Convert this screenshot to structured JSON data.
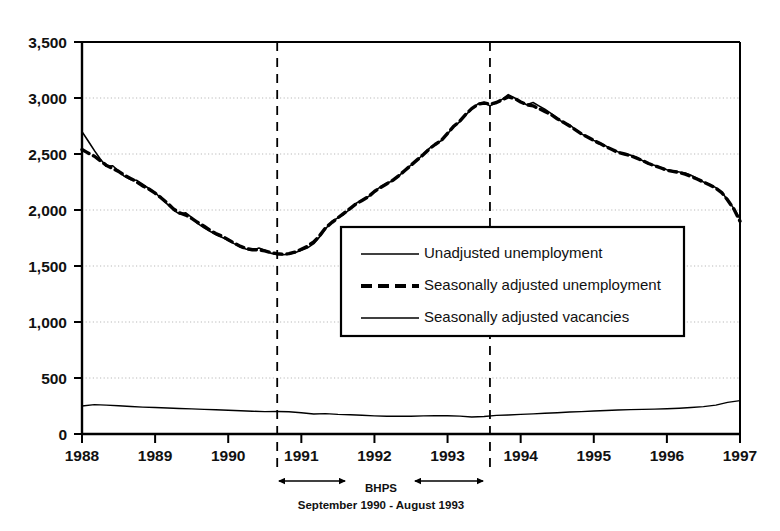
{
  "chart_data": {
    "type": "line",
    "title": "",
    "xlabel": "",
    "ylabel": "",
    "xlim": [
      1988,
      1997
    ],
    "ylim": [
      0,
      3500
    ],
    "grid": true,
    "grid_style": "dotted-horizontal",
    "legend_position": "center",
    "y_ticks": [
      0,
      500,
      1000,
      1500,
      2000,
      2500,
      3000,
      3500
    ],
    "y_tick_labels": [
      "0",
      "500",
      "1,000",
      "1,500",
      "2,000",
      "2,500",
      "3,000",
      "3,500"
    ],
    "x_ticks": [
      1988,
      1989,
      1990,
      1991,
      1992,
      1993,
      1994,
      1995,
      1996,
      1997
    ],
    "x_tick_labels": [
      "1988",
      "1989",
      "1990",
      "1991",
      "1992",
      "1993",
      "1994",
      "1995",
      "1996",
      "1997"
    ],
    "series": [
      {
        "name": "Unadjusted unemployment",
        "style": "solid",
        "color": "#000000",
        "x": [
          1988.0,
          1988.08,
          1988.17,
          1988.25,
          1988.33,
          1988.42,
          1988.5,
          1988.58,
          1988.67,
          1988.75,
          1988.83,
          1988.92,
          1989.0,
          1989.08,
          1989.17,
          1989.25,
          1989.33,
          1989.42,
          1989.5,
          1989.58,
          1989.67,
          1989.75,
          1989.83,
          1989.92,
          1990.0,
          1990.08,
          1990.17,
          1990.25,
          1990.33,
          1990.42,
          1990.5,
          1990.58,
          1990.67,
          1990.75,
          1990.83,
          1990.92,
          1991.0,
          1991.08,
          1991.17,
          1991.25,
          1991.33,
          1991.42,
          1991.5,
          1991.58,
          1991.67,
          1991.75,
          1991.83,
          1991.92,
          1992.0,
          1992.08,
          1992.17,
          1992.25,
          1992.33,
          1992.42,
          1992.5,
          1992.58,
          1992.67,
          1992.75,
          1992.83,
          1992.92,
          1993.0,
          1993.08,
          1993.17,
          1993.25,
          1993.33,
          1993.42,
          1993.5,
          1993.58,
          1993.67,
          1993.75,
          1993.83,
          1993.92,
          1994.0,
          1994.08,
          1994.17,
          1994.25,
          1994.33,
          1994.42,
          1994.5,
          1994.58,
          1994.67,
          1994.75,
          1994.83,
          1994.92,
          1995.0,
          1995.08,
          1995.17,
          1995.25,
          1995.33,
          1995.42,
          1995.5,
          1995.58,
          1995.67,
          1995.75,
          1995.83,
          1995.92,
          1996.0,
          1996.08,
          1996.17,
          1996.25,
          1996.33,
          1996.42,
          1996.5,
          1996.58,
          1996.67,
          1996.75,
          1996.83,
          1996.92,
          1997.0
        ],
        "values": [
          2700,
          2620,
          2530,
          2455,
          2390,
          2395,
          2350,
          2300,
          2270,
          2265,
          2230,
          2190,
          2155,
          2105,
          2050,
          2000,
          1965,
          1975,
          1935,
          1880,
          1840,
          1810,
          1780,
          1755,
          1730,
          1700,
          1670,
          1650,
          1640,
          1660,
          1640,
          1615,
          1600,
          1600,
          1605,
          1620,
          1640,
          1660,
          1700,
          1760,
          1830,
          1900,
          1930,
          1960,
          2010,
          2060,
          2090,
          2120,
          2170,
          2205,
          2240,
          2260,
          2300,
          2360,
          2400,
          2440,
          2500,
          2550,
          2590,
          2620,
          2680,
          2740,
          2790,
          2850,
          2900,
          2950,
          2960,
          2930,
          2960,
          2990,
          3030,
          3000,
          2970,
          2940,
          2960,
          2930,
          2900,
          2860,
          2820,
          2780,
          2760,
          2720,
          2680,
          2650,
          2620,
          2600,
          2570,
          2540,
          2520,
          2500,
          2490,
          2470,
          2440,
          2410,
          2400,
          2380,
          2360,
          2350,
          2340,
          2330,
          2310,
          2280,
          2250,
          2230,
          2200,
          2160,
          2090,
          2010,
          1920
        ]
      },
      {
        "name": "Seasonally adjusted unemployment",
        "style": "dashed",
        "color": "#000000",
        "x": [
          1988.0,
          1988.08,
          1988.17,
          1988.25,
          1988.33,
          1988.42,
          1988.5,
          1988.58,
          1988.67,
          1988.75,
          1988.83,
          1988.92,
          1989.0,
          1989.08,
          1989.17,
          1989.25,
          1989.33,
          1989.42,
          1989.5,
          1989.58,
          1989.67,
          1989.75,
          1989.83,
          1989.92,
          1990.0,
          1990.08,
          1990.17,
          1990.25,
          1990.33,
          1990.42,
          1990.5,
          1990.58,
          1990.67,
          1990.75,
          1990.83,
          1990.92,
          1991.0,
          1991.08,
          1991.17,
          1991.25,
          1991.33,
          1991.42,
          1991.5,
          1991.58,
          1991.67,
          1991.75,
          1991.83,
          1991.92,
          1992.0,
          1992.08,
          1992.17,
          1992.25,
          1992.33,
          1992.42,
          1992.5,
          1992.58,
          1992.67,
          1992.75,
          1992.83,
          1992.92,
          1993.0,
          1993.08,
          1993.17,
          1993.25,
          1993.33,
          1993.42,
          1993.5,
          1993.58,
          1993.67,
          1993.75,
          1993.83,
          1993.92,
          1994.0,
          1994.08,
          1994.17,
          1994.25,
          1994.33,
          1994.42,
          1994.5,
          1994.58,
          1994.67,
          1994.75,
          1994.83,
          1994.92,
          1995.0,
          1995.08,
          1995.17,
          1995.25,
          1995.33,
          1995.42,
          1995.5,
          1995.58,
          1995.67,
          1995.75,
          1995.83,
          1995.92,
          1996.0,
          1996.08,
          1996.17,
          1996.25,
          1996.33,
          1996.42,
          1996.5,
          1996.58,
          1996.67,
          1996.75,
          1996.83,
          1996.92,
          1997.0
        ],
        "values": [
          2540,
          2510,
          2480,
          2440,
          2400,
          2370,
          2345,
          2310,
          2280,
          2250,
          2215,
          2185,
          2150,
          2110,
          2060,
          2010,
          1975,
          1955,
          1925,
          1890,
          1855,
          1820,
          1790,
          1765,
          1735,
          1705,
          1675,
          1655,
          1645,
          1645,
          1635,
          1620,
          1610,
          1605,
          1610,
          1625,
          1650,
          1675,
          1715,
          1770,
          1840,
          1890,
          1930,
          1970,
          2015,
          2055,
          2085,
          2120,
          2165,
          2200,
          2235,
          2265,
          2305,
          2355,
          2400,
          2445,
          2495,
          2545,
          2585,
          2625,
          2685,
          2745,
          2795,
          2855,
          2905,
          2945,
          2955,
          2945,
          2960,
          2985,
          3010,
          2995,
          2965,
          2940,
          2930,
          2905,
          2880,
          2850,
          2815,
          2785,
          2750,
          2715,
          2680,
          2650,
          2620,
          2595,
          2565,
          2540,
          2515,
          2500,
          2485,
          2465,
          2440,
          2415,
          2395,
          2375,
          2355,
          2345,
          2335,
          2320,
          2300,
          2275,
          2250,
          2225,
          2195,
          2155,
          2090,
          2005,
          1900
        ]
      },
      {
        "name": "Seasonally adjusted vacancies",
        "style": "solid-thin",
        "color": "#000000",
        "x": [
          1988.0,
          1988.17,
          1988.33,
          1988.5,
          1988.67,
          1988.83,
          1989.0,
          1989.17,
          1989.33,
          1989.5,
          1989.67,
          1989.83,
          1990.0,
          1990.17,
          1990.33,
          1990.5,
          1990.67,
          1990.83,
          1991.0,
          1991.17,
          1991.33,
          1991.5,
          1991.67,
          1991.83,
          1992.0,
          1992.17,
          1992.33,
          1992.5,
          1992.67,
          1992.83,
          1993.0,
          1993.17,
          1993.33,
          1993.5,
          1993.67,
          1993.83,
          1994.0,
          1994.17,
          1994.33,
          1994.5,
          1994.67,
          1994.83,
          1995.0,
          1995.17,
          1995.33,
          1995.5,
          1995.67,
          1995.83,
          1996.0,
          1996.17,
          1996.33,
          1996.5,
          1996.67,
          1996.83,
          1997.0
        ],
        "values": [
          250,
          262,
          258,
          252,
          246,
          240,
          236,
          232,
          228,
          224,
          220,
          216,
          212,
          208,
          203,
          200,
          201,
          198,
          190,
          178,
          182,
          175,
          172,
          168,
          162,
          158,
          160,
          158,
          162,
          164,
          163,
          160,
          152,
          156,
          166,
          170,
          175,
          180,
          185,
          190,
          196,
          200,
          206,
          210,
          214,
          218,
          220,
          222,
          226,
          230,
          236,
          244,
          258,
          282,
          298
        ]
      }
    ],
    "annotations": [
      {
        "name": "bhps-period",
        "label": "BHPS",
        "sublabel": "September 1990 - August 1993",
        "start_x": 1990.67,
        "end_x": 1993.58,
        "marker_style": "dashed-vertical"
      }
    ]
  },
  "legend": {
    "entries": [
      {
        "label": "Unadjusted unemployment",
        "style": "solid"
      },
      {
        "label": "Seasonally adjusted unemployment",
        "style": "dashed"
      },
      {
        "label": "Seasonally adjusted vacancies",
        "style": "solid"
      }
    ]
  }
}
